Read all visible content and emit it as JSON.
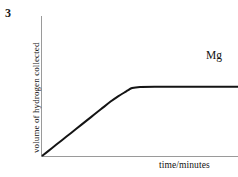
{
  "figure": {
    "question_number": "3",
    "background_color": "#ffffff",
    "width": 238,
    "height": 177
  },
  "axes": {
    "axis_color": "#9a9a9a",
    "origin_px": [
      41,
      156
    ],
    "y_axis_top_px": 16,
    "x_axis_right_px": 238
  },
  "chart_data": {
    "type": "line",
    "title": "",
    "subtitle": "",
    "xlabel": "time/minutes",
    "ylabel": "volume of hydrogen collected",
    "grid": false,
    "legend_position": "inline-right",
    "annotations": [
      {
        "text": "Mg",
        "position": "above right end of curve plateau"
      }
    ],
    "xlim": [
      0,
      10
    ],
    "ylim": [
      0,
      10
    ],
    "xticks": [],
    "yticks": [],
    "series": [
      {
        "name": "Mg",
        "color": "#141414",
        "line_width": 2,
        "description": "Linear rise from the origin at constant rate, smooth knee, then a flat plateau held to the right-hand edge",
        "x": [
          0.0,
          0.5,
          1.0,
          1.5,
          2.0,
          2.5,
          3.0,
          3.5,
          3.9,
          4.2,
          4.4,
          4.6,
          5.0,
          6.0,
          7.0,
          8.0,
          9.0,
          10.0
        ],
        "y": [
          0.0,
          0.72,
          1.44,
          2.16,
          2.88,
          3.6,
          4.32,
          5.04,
          5.55,
          5.88,
          6.1,
          6.3,
          6.4,
          6.42,
          6.42,
          6.42,
          6.42,
          6.42
        ]
      }
    ]
  }
}
